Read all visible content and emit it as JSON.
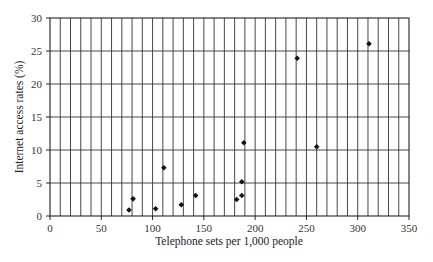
{
  "chart_data": {
    "type": "scatter",
    "title": "",
    "xlabel": "Telephone sets per 1,000 people",
    "ylabel": "Internet access rates (%)",
    "xlim": [
      0,
      350
    ],
    "ylim": [
      0,
      30
    ],
    "x_ticks": [
      0,
      50,
      100,
      150,
      200,
      250,
      300,
      350
    ],
    "y_ticks": [
      0,
      5,
      10,
      15,
      20,
      25,
      30
    ],
    "grid": {
      "vertical_step": 10,
      "horizontal_step": 5,
      "on": true
    },
    "legend": null,
    "marker": "diamond",
    "marker_color": "#111111",
    "points": [
      {
        "x": 77,
        "y": 0.9
      },
      {
        "x": 81,
        "y": 2.6
      },
      {
        "x": 103,
        "y": 1.1
      },
      {
        "x": 111,
        "y": 7.3
      },
      {
        "x": 128,
        "y": 1.7
      },
      {
        "x": 142,
        "y": 3.1
      },
      {
        "x": 182,
        "y": 2.5
      },
      {
        "x": 187,
        "y": 3.1
      },
      {
        "x": 187,
        "y": 5.2
      },
      {
        "x": 189,
        "y": 11.1
      },
      {
        "x": 241,
        "y": 23.9
      },
      {
        "x": 260,
        "y": 10.5
      },
      {
        "x": 311,
        "y": 26.1
      }
    ]
  }
}
